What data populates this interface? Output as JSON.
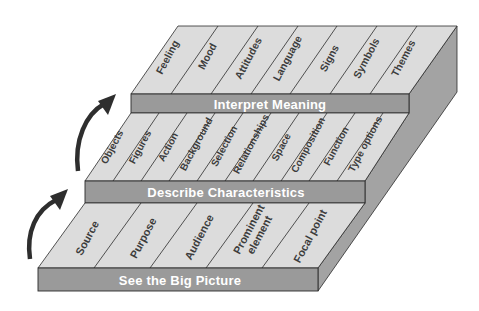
{
  "diagram": {
    "type": "stacked-steps",
    "tiers": [
      {
        "label": "See the Big Picture",
        "items": [
          "Source",
          "Purpose",
          "Audience",
          "Prominent element",
          "Focal point"
        ]
      },
      {
        "label": "Describe Characteristics",
        "items": [
          "Objects",
          "Figures",
          "Action",
          "Background",
          "Selection",
          "Relationships",
          "Space",
          "Composition",
          "Function",
          "Type options"
        ]
      },
      {
        "label": "Interpret Meaning",
        "items": [
          "Feeling",
          "Mood",
          "Attitudes",
          "Language",
          "Signs",
          "Symbols",
          "Themes"
        ]
      }
    ],
    "prominent_line1": "Prominent",
    "prominent_line2": "element",
    "arrows": [
      "up-arrow-1",
      "up-arrow-2"
    ],
    "colors": {
      "surface": "#dcdcdc",
      "band": "#9a9a9a",
      "side": "#a3a3a3",
      "text_band": "#ffffff",
      "text_cell": "#3c3c3c",
      "arrow": "#2e2e2e"
    }
  }
}
